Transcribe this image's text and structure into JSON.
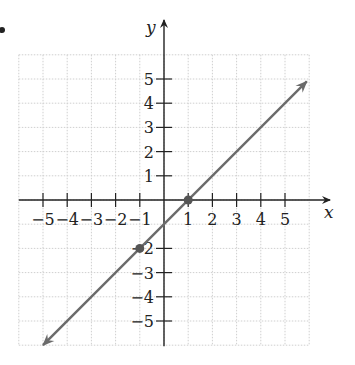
{
  "chart_data": {
    "type": "line",
    "title": "",
    "xlabel": "x",
    "ylabel": "y",
    "xlim": [
      -6,
      6
    ],
    "ylim": [
      -6,
      6
    ],
    "grid": true,
    "x_ticks": [
      -5,
      -4,
      -3,
      -2,
      -1,
      1,
      2,
      3,
      4,
      5
    ],
    "y_ticks": [
      5,
      4,
      3,
      2,
      1,
      -2,
      -3,
      -4,
      -5
    ],
    "x_tick_labels": [
      "−5",
      "−4",
      "−3",
      "−2",
      "−1",
      "1",
      "2",
      "3",
      "4",
      "5"
    ],
    "y_tick_labels": [
      "5",
      "4",
      "3",
      "2",
      "1",
      "−2",
      "−3",
      "−4",
      "−5"
    ],
    "series": [
      {
        "name": "line",
        "equation": "y = x - 1",
        "slope": 1,
        "intercept": -1,
        "x": [
          -5,
          5.9
        ],
        "y": [
          -6,
          4.9
        ],
        "arrows": "both",
        "color": "#6b6b6b"
      }
    ],
    "marked_points": [
      {
        "x": -1,
        "y": -2
      },
      {
        "x": 1,
        "y": 0
      }
    ]
  },
  "labels": {
    "x_axis": "x",
    "y_axis": "y"
  },
  "colors": {
    "axis": "#222222",
    "grid": "#cfcfcf",
    "line": "#6b6b6b",
    "point": "#555555"
  }
}
